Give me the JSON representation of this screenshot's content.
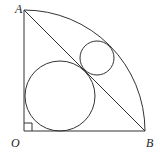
{
  "diagram": {
    "labels": {
      "A": "A",
      "O": "O",
      "B": "B"
    },
    "points": {
      "A": [
        24,
        10
      ],
      "O": [
        24,
        131
      ],
      "B": [
        145,
        131
      ]
    },
    "arc_radius": 121,
    "large_circle": {
      "cx": 60,
      "cy": 96,
      "r": 35
    },
    "small_circle": {
      "cx": 97,
      "cy": 58,
      "r": 17
    },
    "right_angle_marker_size": 8,
    "stroke_color": "#333333"
  }
}
